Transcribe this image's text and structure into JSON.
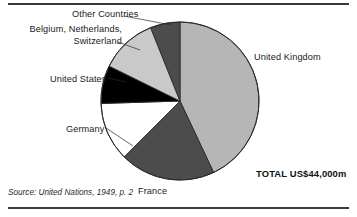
{
  "figure": {
    "source_note": "Source: United Nations, 1949, p. 2",
    "total_label": "TOTAL US$44,000m",
    "rule_color": "#3a3a3a"
  },
  "labels": {
    "other_countries": "Other Countries",
    "benelux": "Belgium, Netherlands, Switzerland",
    "united_states": "United States",
    "germany": "Germany",
    "france": "France",
    "united_kingdom": "United Kingdom"
  },
  "chart_data": {
    "type": "pie",
    "title": "",
    "subtitle": "",
    "xlabel": "",
    "ylabel": "",
    "legend_position": "callout-labels",
    "grid": false,
    "total_value": 44000,
    "total_units": "US$ millions",
    "total_display": "TOTAL US$44,000m",
    "start_angle_deg": 0,
    "direction": "clockwise",
    "center": {
      "x": 180,
      "y": 101
    },
    "radius": 79,
    "categories": [
      "United Kingdom",
      "France",
      "Germany",
      "United States",
      "Belgium, Netherlands, Switzerland",
      "Other Countries"
    ],
    "values": [
      18920,
      8560,
      5280,
      3430,
      5130,
      2680
    ],
    "percents": [
      43.0,
      19.5,
      12.0,
      7.8,
      11.7,
      6.0
    ],
    "angles_deg": [
      154.8,
      70.2,
      43.2,
      28.0,
      42.0,
      21.8
    ],
    "colors": [
      "#b6b6b6",
      "#4c4c4c",
      "#ffffff",
      "#000000",
      "#c9c9c9",
      "#4c4c4c"
    ],
    "slice_outline_color": "#2b2b2b",
    "slices": [
      {
        "label": "United Kingdom",
        "value": 18920,
        "percent": 43.0,
        "start_deg": 0.0,
        "end_deg": 154.8,
        "color": "#b6b6b6"
      },
      {
        "label": "France",
        "value": 8560,
        "percent": 19.5,
        "start_deg": 154.8,
        "end_deg": 225.0,
        "color": "#4c4c4c"
      },
      {
        "label": "Germany",
        "value": 5280,
        "percent": 12.0,
        "start_deg": 225.0,
        "end_deg": 268.2,
        "color": "#ffffff"
      },
      {
        "label": "United States",
        "value": 3430,
        "percent": 7.8,
        "start_deg": 268.2,
        "end_deg": 296.2,
        "color": "#000000"
      },
      {
        "label": "Belgium, Netherlands, Switzerland",
        "value": 5130,
        "percent": 11.7,
        "start_deg": 296.2,
        "end_deg": 338.2,
        "color": "#c9c9c9"
      },
      {
        "label": "Other Countries",
        "value": 2680,
        "percent": 6.0,
        "start_deg": 338.2,
        "end_deg": 360.0,
        "color": "#4c4c4c"
      }
    ]
  }
}
